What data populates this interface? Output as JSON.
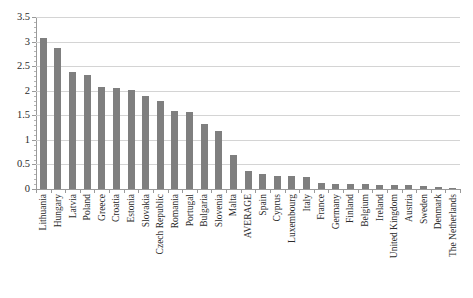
{
  "chart_data": {
    "type": "bar",
    "title": "",
    "subtitle": "",
    "xlabel": "",
    "ylabel": "",
    "ylim": [
      0,
      3.5
    ],
    "ytick_step": 0.5,
    "grid": true,
    "legend": false,
    "legend_position": "none",
    "orientation": "vertical",
    "bar_color": "#7f7f7f",
    "gridline_color": "#d4d4d4",
    "axis_color": "#9a9a9a",
    "categories": [
      "Lithuania",
      "Hungary",
      "Latvia",
      "Poland",
      "Greece",
      "Croatia",
      "Estonia",
      "Slovakia",
      "Czech Republic",
      "Romania",
      "Portugal",
      "Bulgaria",
      "Slovenia",
      "Malta",
      "AVERAGE",
      "Spain",
      "Cyprus",
      "Luxembourg",
      "Italy",
      "France",
      "Germany",
      "Finland",
      "Belgium",
      "Ireland",
      "United Kingdom",
      "Austria",
      "Sweden",
      "Denmark",
      "The Netherlands"
    ],
    "values": [
      3.08,
      2.87,
      2.39,
      2.31,
      2.07,
      2.05,
      2.01,
      1.9,
      1.79,
      1.59,
      1.56,
      1.33,
      1.18,
      0.7,
      0.37,
      0.3,
      0.27,
      0.27,
      0.24,
      0.12,
      0.11,
      0.1,
      0.1,
      0.09,
      0.09,
      0.09,
      0.07,
      0.04,
      0.02
    ],
    "ytick_labels": [
      "0",
      "0.5",
      "1",
      "1.5",
      "2",
      "2.5",
      "3",
      "3.5"
    ],
    "ytick_values": [
      0,
      0.5,
      1,
      1.5,
      2,
      2.5,
      3,
      3.5
    ]
  }
}
